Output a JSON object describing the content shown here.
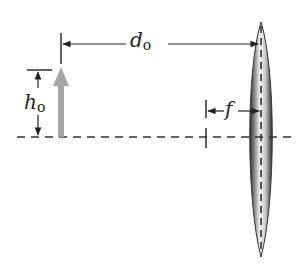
{
  "diagram": {
    "type": "thin-lens-object-diagram",
    "labels": {
      "object_distance": {
        "symbol": "d",
        "subscript": "o"
      },
      "object_height": {
        "symbol": "h",
        "subscript": "o"
      },
      "focal_length": {
        "symbol": "f",
        "subscript": ""
      }
    },
    "elements": [
      "optical-axis",
      "object-arrow",
      "converging-lens",
      "focal-point-marker",
      "lens-centerline"
    ],
    "colors": {
      "line": "#222222",
      "object_arrow": "#a6a6a6",
      "lens_dark": "#3a3a3a",
      "lens_light": "#f2f2f2"
    }
  }
}
